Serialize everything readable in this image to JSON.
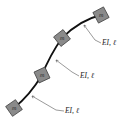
{
  "diagram": {
    "colors": {
      "rod": "#111111",
      "mass_fill": "#8a8a8a",
      "mass_stroke": "#3a3a3a",
      "leader": "#555555",
      "text": "#222222"
    },
    "masses": [
      {
        "label": "m",
        "x": 101,
        "y": 15
      },
      {
        "label": "m",
        "x": 62,
        "y": 38
      },
      {
        "label": "m",
        "x": 42,
        "y": 75
      },
      {
        "label": "m",
        "x": 14,
        "y": 108
      }
    ],
    "segments": [
      {
        "label": "EI, ℓ",
        "tx": 102,
        "ty": 45
      },
      {
        "label": "EI, ℓ",
        "tx": 80,
        "ty": 78
      },
      {
        "label": "EI, ℓ",
        "tx": 65,
        "ty": 113
      }
    ]
  }
}
